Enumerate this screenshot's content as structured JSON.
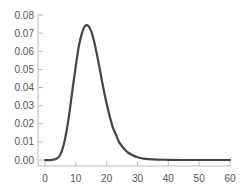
{
  "chart_data": {
    "type": "line",
    "title": "",
    "xlabel": "",
    "ylabel": "",
    "xlim": [
      0,
      60
    ],
    "ylim": [
      0,
      0.08
    ],
    "grid": false,
    "legend": null,
    "x_ticks": [
      "0",
      "10",
      "20",
      "30",
      "40",
      "50",
      "60"
    ],
    "y_ticks": [
      "0.00",
      "0.01",
      "0.02",
      "0.03",
      "0.04",
      "0.05",
      "0.06",
      "0.07",
      "0.08"
    ],
    "series": [
      {
        "name": "density",
        "color": "#444444",
        "x": [
          0,
          2,
          4,
          5,
          6,
          7,
          8,
          9,
          10,
          11,
          12,
          13,
          14,
          15,
          16,
          17,
          18,
          19,
          20,
          21,
          22,
          23,
          24,
          25,
          26,
          27,
          28,
          30,
          32,
          35,
          40,
          45,
          50,
          55,
          60
        ],
        "y": [
          0.0,
          0.0,
          0.001,
          0.003,
          0.008,
          0.016,
          0.027,
          0.04,
          0.052,
          0.063,
          0.07,
          0.074,
          0.074,
          0.071,
          0.065,
          0.057,
          0.048,
          0.039,
          0.031,
          0.024,
          0.018,
          0.014,
          0.01,
          0.0075,
          0.0055,
          0.004,
          0.003,
          0.0015,
          0.0008,
          0.0003,
          0.0001,
          0.0,
          0.0,
          0.0,
          0.0
        ]
      }
    ]
  },
  "colors": {
    "line": "#444444",
    "axis": "#bbbbbb",
    "tick_text": "#555555"
  }
}
